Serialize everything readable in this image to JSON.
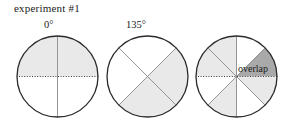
{
  "figure": {
    "title": "experiment #1",
    "overlap_label": "overlap",
    "colors": {
      "light_shade": "#e9e9e9",
      "dark_shade": "#a9a9a9",
      "white": "#ffffff",
      "outline": "#2b2b2b",
      "sector_line": "#8a8a8a",
      "dotted_axis": "#2b2b2b",
      "text": "#1a1a1a"
    },
    "circles": [
      {
        "name": "circle-0-degrees",
        "angle_label": "0°",
        "cx": 57.5,
        "cy": 76.5,
        "r": 40.5,
        "sectors": [
          {
            "name": "sector-0-90",
            "start": 0,
            "end": 90,
            "fill": "light"
          },
          {
            "name": "sector-90-180",
            "start": 90,
            "end": 180,
            "fill": "light"
          },
          {
            "name": "sector-180-270",
            "start": 180,
            "end": 270,
            "fill": "white"
          },
          {
            "name": "sector-270-360",
            "start": 270,
            "end": 360,
            "fill": "white"
          }
        ],
        "divider_lines": [
          {
            "name": "vertical-divider",
            "angle": 90,
            "style": "solid"
          },
          {
            "name": "horizontal-dotted-axis",
            "angle": 0,
            "style": "dotted"
          }
        ]
      },
      {
        "name": "circle-135-degrees",
        "angle_label": "135°",
        "cx": 147.5,
        "cy": 76.5,
        "r": 40.5,
        "sectors": [
          {
            "name": "sector-315-45",
            "start": 315,
            "end": 45,
            "fill": "light"
          },
          {
            "name": "sector-45-135",
            "start": 45,
            "end": 135,
            "fill": "white"
          },
          {
            "name": "sector-135-225",
            "start": 135,
            "end": 225,
            "fill": "white"
          },
          {
            "name": "sector-225-315",
            "start": 225,
            "end": 315,
            "fill": "light"
          }
        ],
        "divider_lines": [
          {
            "name": "diagonal-divider-45",
            "angle": 45,
            "style": "solid"
          },
          {
            "name": "diagonal-divider-135",
            "angle": 135,
            "style": "solid"
          }
        ]
      },
      {
        "name": "circle-overlap",
        "angle_label": "",
        "cx": 236.5,
        "cy": 76.5,
        "r": 40.5,
        "sectors": [
          {
            "name": "sector-0-45",
            "start": 0,
            "end": 45,
            "fill": "dark"
          },
          {
            "name": "sector-45-90",
            "start": 45,
            "end": 90,
            "fill": "white"
          },
          {
            "name": "sector-90-135",
            "start": 90,
            "end": 135,
            "fill": "light"
          },
          {
            "name": "sector-135-180",
            "start": 135,
            "end": 180,
            "fill": "light"
          },
          {
            "name": "sector-180-225",
            "start": 180,
            "end": 225,
            "fill": "white"
          },
          {
            "name": "sector-225-270",
            "start": 225,
            "end": 270,
            "fill": "light"
          },
          {
            "name": "sector-270-315",
            "start": 270,
            "end": 315,
            "fill": "white"
          },
          {
            "name": "sector-315-360",
            "start": 315,
            "end": 360,
            "fill": "light"
          }
        ],
        "divider_lines": [
          {
            "name": "vertical-divider",
            "angle": 90,
            "style": "solid"
          },
          {
            "name": "diagonal-divider-45",
            "angle": 45,
            "style": "solid"
          },
          {
            "name": "diagonal-divider-135",
            "angle": 135,
            "style": "solid"
          },
          {
            "name": "horizontal-dotted-axis",
            "angle": 0,
            "style": "dotted"
          }
        ]
      }
    ]
  }
}
